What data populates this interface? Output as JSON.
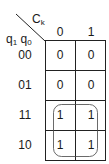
{
  "kmap": {
    "column_variable": "C",
    "column_variable_sub": "k",
    "row_variables": [
      {
        "name": "q",
        "sub": "1"
      },
      {
        "name": "q",
        "sub": "0"
      }
    ],
    "column_headers": [
      "0",
      "1"
    ],
    "row_headers": [
      "00",
      "01",
      "11",
      "10"
    ],
    "cells": [
      [
        "0",
        "0"
      ],
      [
        "0",
        "0"
      ],
      [
        "1",
        "1"
      ],
      [
        "1",
        "1"
      ]
    ],
    "groups": [
      {
        "rows": [
          "11",
          "10"
        ],
        "columns": [
          "0",
          "1"
        ]
      }
    ]
  }
}
